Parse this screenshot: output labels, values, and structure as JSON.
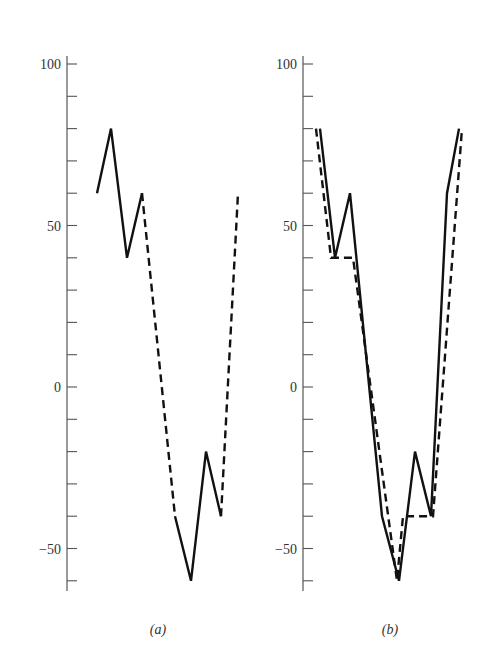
{
  "chart_data": [
    {
      "type": "line",
      "panel_label": "(a)",
      "title": "",
      "xlabel": "",
      "ylabel": "",
      "ylim": [
        -63,
        104
      ],
      "y_ticks_labeled": [
        100,
        50,
        0,
        -50
      ],
      "y_tick_labels": [
        "100",
        "50",
        "0",
        "−50"
      ],
      "y_minor_tick_step": 10,
      "grid": false,
      "series": [
        {
          "name": "signal segment 1",
          "style": "solid",
          "values": [
            60,
            80,
            40,
            60
          ]
        },
        {
          "name": "gap interpolation 1",
          "style": "dashed",
          "values": [
            60,
            -40
          ]
        },
        {
          "name": "signal segment 2",
          "style": "solid",
          "values": [
            -40,
            -60,
            -20,
            -40
          ]
        },
        {
          "name": "gap interpolation 2",
          "style": "dashed",
          "values": [
            -40,
            60
          ]
        }
      ]
    },
    {
      "type": "line",
      "panel_label": "(b)",
      "title": "",
      "xlabel": "",
      "ylabel": "",
      "ylim": [
        -63,
        104
      ],
      "y_ticks_labeled": [
        100,
        50,
        0,
        -50
      ],
      "y_tick_labels": [
        "100",
        "50",
        "0",
        "−50"
      ],
      "y_minor_tick_step": 10,
      "grid": false,
      "series": [
        {
          "name": "original signal",
          "style": "solid",
          "values": [
            80,
            40,
            60,
            -40,
            -60,
            -20,
            -40,
            60,
            80
          ]
        },
        {
          "name": "approximation",
          "style": "dashed",
          "values": [
            80,
            40,
            40,
            -60,
            -40,
            -40,
            80
          ]
        }
      ]
    }
  ],
  "layout": {
    "y_scale": {
      "value_top": 100,
      "pixel_top": 64,
      "pixel_per_unit": 3.23
    },
    "panels": [
      {
        "axis_x": 67,
        "axis_top": 56,
        "axis_bottom": 591,
        "label_x": 158,
        "label_y": 634,
        "series_x": [
          [
            97,
            111,
            127,
            142
          ],
          [
            142,
            175
          ],
          [
            175,
            191,
            206,
            221
          ],
          [
            221,
            238
          ]
        ]
      },
      {
        "axis_x": 303,
        "axis_top": 56,
        "axis_bottom": 591,
        "label_x": 390,
        "label_y": 634,
        "series_x": [
          [
            320,
            335,
            350,
            382,
            399,
            415,
            431,
            447,
            459
          ],
          [
            316,
            331,
            353,
            397,
            403,
            433,
            462
          ]
        ]
      }
    ]
  }
}
